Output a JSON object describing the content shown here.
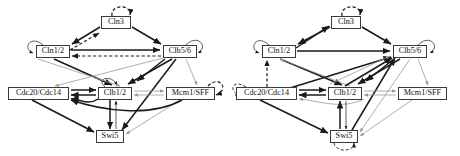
{
  "figure": {
    "title": "",
    "panel_count": 2
  },
  "diagrams": [
    {
      "id": "left",
      "label": "",
      "nodes": [
        {
          "id": "cln3",
          "label": "Cln3",
          "x": 101,
          "y": 16,
          "w": 30,
          "self_loop": "dashed"
        },
        {
          "id": "cln12",
          "label": "Cln1/2",
          "x": 36,
          "y": 45,
          "w": 34,
          "self_loop": "solid"
        },
        {
          "id": "clb56",
          "label": "Clb5/6",
          "x": 163,
          "y": 45,
          "w": 34,
          "self_loop": "solid"
        },
        {
          "id": "cdc",
          "label": "Cdc20/Cdc14",
          "x": 8,
          "y": 87,
          "w": 61,
          "self_loop": "none"
        },
        {
          "id": "clb12",
          "label": "Clb1/2",
          "x": 98,
          "y": 87,
          "w": 34,
          "self_loop": "solid"
        },
        {
          "id": "mcm1",
          "label": "Mcm1/SFF",
          "x": 166,
          "y": 87,
          "w": 49,
          "self_loop": "dashed"
        },
        {
          "id": "swi5",
          "label": "Swi5",
          "x": 96,
          "y": 130,
          "w": 28,
          "self_loop": "none"
        }
      ]
    },
    {
      "id": "right",
      "label": "",
      "nodes": [
        {
          "id": "cln3",
          "label": "Cln3",
          "x": 101,
          "y": 16,
          "w": 30,
          "self_loop": "dashed"
        },
        {
          "id": "cln12",
          "label": "Cln1/2",
          "x": 32,
          "y": 45,
          "w": 34,
          "self_loop": "solid"
        },
        {
          "id": "clb56",
          "label": "Clb5/6",
          "x": 163,
          "y": 45,
          "w": 34,
          "self_loop": "solid"
        },
        {
          "id": "cdc",
          "label": "Cdc20/Cdc14",
          "x": 6,
          "y": 87,
          "w": 61,
          "self_loop": "dashed"
        },
        {
          "id": "clb12",
          "label": "Clb1/2",
          "x": 98,
          "y": 87,
          "w": 34,
          "self_loop": "none"
        },
        {
          "id": "mcm1",
          "label": "Mcm1/SFF",
          "x": 168,
          "y": 87,
          "w": 49,
          "self_loop": "none"
        },
        {
          "id": "swi5",
          "label": "Swi5",
          "x": 100,
          "y": 130,
          "w": 28,
          "self_loop": "dashed"
        }
      ]
    }
  ],
  "legend": {
    "edge_styles": [
      {
        "name": "activation",
        "style": "solid-black-arrow",
        "color": "#1a1a1a"
      },
      {
        "name": "inhibition",
        "style": "gray-arrow",
        "color": "#9a9a9a"
      },
      {
        "name": "inferred",
        "style": "dashed-arrow",
        "color": "#1a1a1a"
      }
    ]
  },
  "colors": {
    "node_border": "#3a3a3a",
    "node_fill": "#ffffff",
    "edge_dark": "#1a1a1a",
    "edge_gray": "#9a9a9a",
    "background": "#ffffff"
  }
}
